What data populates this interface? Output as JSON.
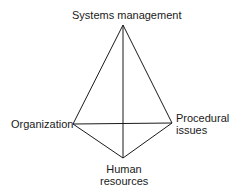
{
  "diagram": {
    "type": "tetrahedron",
    "vertices": {
      "top": {
        "label": "Systems management"
      },
      "left": {
        "label": "Organization"
      },
      "right": {
        "label_line1": "Procedural",
        "label_line2": "issues"
      },
      "bottom": {
        "label_line1": "Human",
        "label_line2": "resources"
      }
    },
    "line_color": "#1a1a1a"
  }
}
